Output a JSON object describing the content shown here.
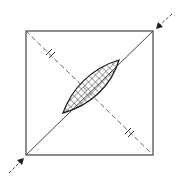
{
  "caption_fragment": "",
  "diagram": {
    "type": "crossed-square-with-hatched-lens",
    "square": {
      "x1": 26,
      "y1": 31,
      "x2": 153,
      "y2": 155
    },
    "solid_diagonal": "bottom-left to top-right",
    "dashed_diagonal": "top-left to bottom-right",
    "equal_marks": [
      {
        "x": 50,
        "y": 53,
        "symbol": "double-tick"
      },
      {
        "x": 129,
        "y": 132,
        "symbol": "double-tick"
      }
    ],
    "lens": {
      "from": [
        63,
        113
      ],
      "to": [
        119,
        60
      ],
      "fill": "cross-hatch"
    },
    "arrows": [
      {
        "from": [
          172,
          14
        ],
        "to": [
          157,
          28
        ],
        "label": ""
      },
      {
        "from": [
          9,
          173
        ],
        "to": [
          23,
          159
        ],
        "label": ""
      }
    ],
    "colors": {
      "line": "#333333",
      "dashed": "#666666",
      "hatch": "#333333",
      "background": "#ffffff"
    }
  }
}
